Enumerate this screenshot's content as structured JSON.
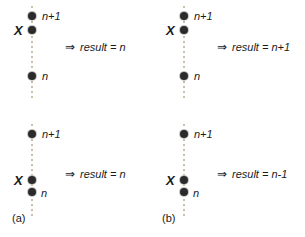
{
  "figure": {
    "type": "diagram",
    "axis_color": "#c9c0ac",
    "dot_color": "#2b2b2b",
    "text_color": "#1a1a1a",
    "background": "#ffffff"
  },
  "panels": [
    {
      "id": "a-top",
      "column": "a",
      "row": "top",
      "marker": "X",
      "arrow": "⇒",
      "result_text": "result = n",
      "result_prefix": "result = ",
      "result_value": "n",
      "dots": [
        {
          "label": "n+1",
          "y": 16,
          "has_label": true,
          "marked": false
        },
        {
          "label": "",
          "y": 30,
          "has_label": false,
          "marked": true
        },
        {
          "label": "n",
          "y": 76,
          "has_label": true,
          "marked": false
        }
      ]
    },
    {
      "id": "b-top",
      "column": "b",
      "row": "top",
      "marker": "X",
      "arrow": "⇒",
      "result_text": "result = n+1",
      "result_prefix": "result = ",
      "result_value": "n+1",
      "dots": [
        {
          "label": "n+1",
          "y": 16,
          "has_label": true,
          "marked": false
        },
        {
          "label": "",
          "y": 30,
          "has_label": false,
          "marked": true
        },
        {
          "label": "n",
          "y": 76,
          "has_label": true,
          "marked": false
        }
      ]
    },
    {
      "id": "a-bottom",
      "column": "a",
      "row": "bottom",
      "marker": "X",
      "arrow": "⇒",
      "result_text": "result = n",
      "result_prefix": "result = ",
      "result_value": "n",
      "dots": [
        {
          "label": "n+1",
          "y": 16,
          "has_label": true,
          "marked": false
        },
        {
          "label": "",
          "y": 62,
          "has_label": false,
          "marked": true
        },
        {
          "label": "n",
          "y": 74,
          "has_label": true,
          "marked": false
        }
      ]
    },
    {
      "id": "b-bottom",
      "column": "b",
      "row": "bottom",
      "marker": "X",
      "arrow": "⇒",
      "result_text": "result = n-1",
      "result_prefix": "result = ",
      "result_value": "n-1",
      "dots": [
        {
          "label": "n+1",
          "y": 16,
          "has_label": true,
          "marked": false
        },
        {
          "label": "",
          "y": 62,
          "has_label": false,
          "marked": true
        },
        {
          "label": "n",
          "y": 74,
          "has_label": true,
          "marked": false
        }
      ]
    }
  ],
  "captions": {
    "a": "(a)",
    "b": "(b)"
  }
}
